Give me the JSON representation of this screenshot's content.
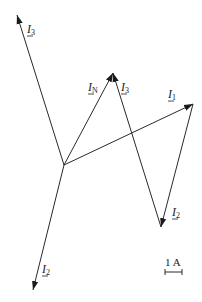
{
  "diagram": {
    "type": "phasor-diagram",
    "vectors": [
      {
        "id": "I3_standalone",
        "name": "I",
        "sub": "3"
      },
      {
        "id": "I2_standalone",
        "name": "I",
        "sub": "2"
      },
      {
        "id": "I1_chain",
        "name": "I",
        "sub": "1"
      },
      {
        "id": "I2_chain",
        "name": "I",
        "sub": "2"
      },
      {
        "id": "I3_chain",
        "name": "I",
        "sub": "3"
      },
      {
        "id": "IN_resultant",
        "name": "I",
        "sub": "N"
      }
    ],
    "scale": {
      "label": "1 A"
    },
    "colors": {
      "line": "#2a2a2a",
      "text": "#222222",
      "background": "#ffffff"
    }
  }
}
